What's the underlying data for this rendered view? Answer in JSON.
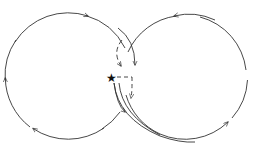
{
  "diagram": {
    "colors": {
      "stroke": "#333333",
      "star": "#111111",
      "background": "#ffffff"
    },
    "left_circle": {
      "cx": 68,
      "cy": 76,
      "r": 63,
      "direction": "clockwise"
    },
    "right_circle": {
      "cx": 186,
      "cy": 77,
      "r": 62,
      "direction": "counterclockwise"
    },
    "star": {
      "x": 112,
      "y": 77,
      "symbol": "★"
    },
    "dashed_paths": 3,
    "arrows": 9
  }
}
